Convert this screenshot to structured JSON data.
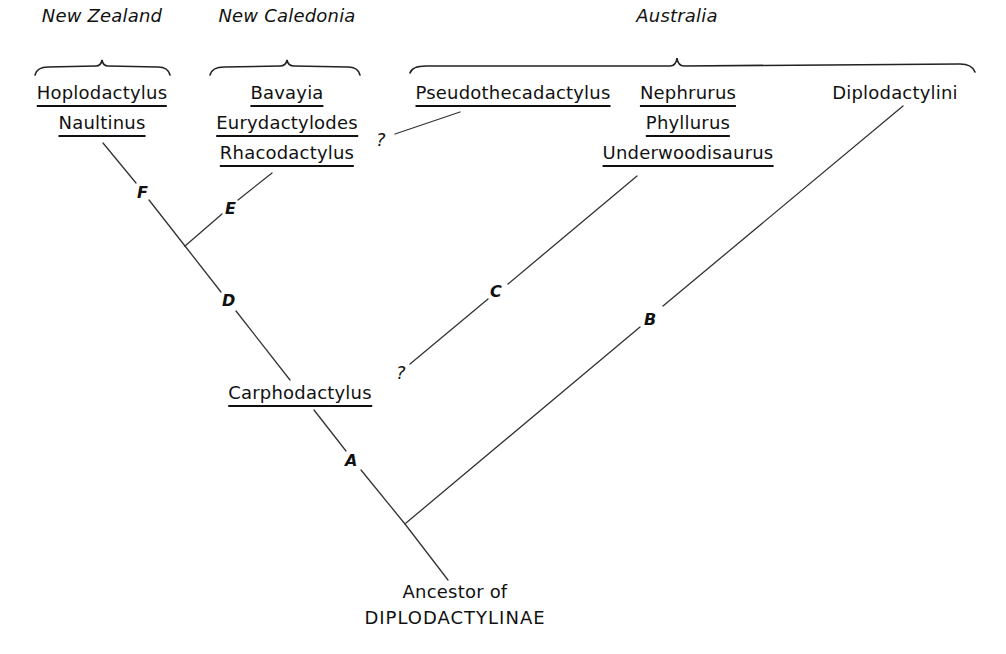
{
  "diagram": {
    "regions": [
      {
        "id": "new-zealand",
        "label": "New Zealand"
      },
      {
        "id": "new-caledonia",
        "label": "New Caledonia"
      },
      {
        "id": "australia",
        "label": "Australia"
      }
    ],
    "taxa": {
      "hoplodactylus": "Hoplodactylus",
      "naultinus": "Naultinus",
      "bavayia": "Bavayia",
      "eurydactylodes": "Eurydactylodes",
      "rhacodactylus": "Rhacodactylus",
      "pseudothecadactylus": "Pseudothecadactylus",
      "nephrurus": "Nephrurus",
      "phyllurus": "Phyllurus",
      "underwoodisaurus": "Underwoodisaurus",
      "diplodactylini": "Diplodactylini",
      "carphodactylus": "Carphodactylus"
    },
    "root": {
      "line1": "Ancestor of",
      "line2": "DIPLODACTYLINAE"
    },
    "branch_labels": {
      "A": "A",
      "B": "B",
      "C": "C",
      "D": "D",
      "E": "E",
      "F": "F"
    },
    "uncertain_marks": {
      "pseudothecadactylus_link": "?",
      "underwoodisaurus_link": "?"
    },
    "groups": [
      {
        "region": "New Zealand",
        "members": [
          "Hoplodactylus",
          "Naultinus"
        ],
        "branch": "F"
      },
      {
        "region": "New Caledonia",
        "members": [
          "Bavayia",
          "Eurydactylodes",
          "Rhacodactylus"
        ],
        "branch": "E"
      },
      {
        "region": "Australia",
        "members": [
          "Pseudothecadactylus"
        ],
        "branch": "?"
      },
      {
        "region": "Australia",
        "members": [
          "Nephrurus",
          "Phyllurus",
          "Underwoodisaurus"
        ],
        "branch": "C"
      },
      {
        "region": "Australia",
        "members": [
          "Diplodactylini"
        ],
        "branch": "B"
      }
    ]
  }
}
